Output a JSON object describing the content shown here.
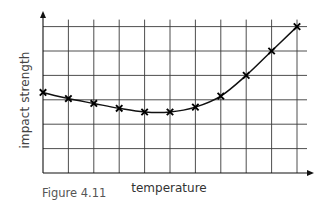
{
  "chart_data": {
    "type": "line",
    "title": "",
    "caption": "Figure 4.11",
    "xlabel": "temperature",
    "ylabel": "impact strength",
    "x": [
      0,
      1,
      2,
      3,
      4,
      5,
      6,
      7,
      8,
      9,
      10
    ],
    "series": [
      {
        "name": "impact strength",
        "marker": "x",
        "values": [
          3.3,
          3.05,
          2.85,
          2.65,
          2.5,
          2.5,
          2.7,
          3.15,
          4.0,
          5.0,
          6.0
        ]
      }
    ],
    "xlim": [
      0,
      10.6
    ],
    "ylim": [
      0,
      6.3
    ],
    "grid": true,
    "grid_cols": 10,
    "grid_rows": 6,
    "tick_labels": false,
    "legend": "none",
    "colors": {
      "line": "#111111",
      "grid": "#3a3a3a",
      "text": "#444444"
    }
  }
}
